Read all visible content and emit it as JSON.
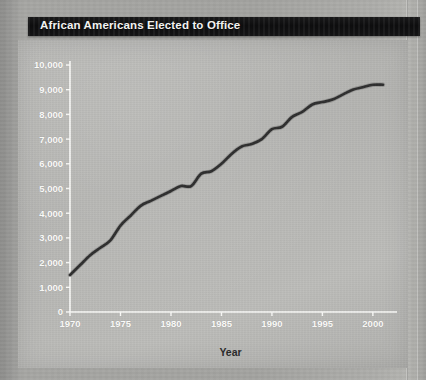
{
  "page": {
    "title": "African Americans Elected to Office"
  },
  "chart_data": {
    "type": "line",
    "title": "African Americans Elected to Office",
    "xlabel": "Year",
    "ylabel": "",
    "xlim": [
      1970,
      2001
    ],
    "ylim": [
      0,
      10000
    ],
    "grid": false,
    "legend": null,
    "line_color": "#2e2e2e",
    "x_ticks": [
      "1970",
      "1975",
      "1980",
      "1985",
      "1990",
      "1995",
      "2000"
    ],
    "x_tick_values": [
      1970,
      1975,
      1980,
      1985,
      1990,
      1995,
      2000
    ],
    "y_ticks": [
      "0",
      "1,000",
      "2,000",
      "3,000",
      "4,000",
      "5,000",
      "6,000",
      "7,000",
      "8,000",
      "9,000",
      "10,000"
    ],
    "y_tick_values": [
      0,
      1000,
      2000,
      3000,
      4000,
      5000,
      6000,
      7000,
      8000,
      9000,
      10000
    ],
    "series": [
      {
        "name": "African Americans Elected to Office",
        "x": [
          1970,
          1971,
          1972,
          1973,
          1974,
          1975,
          1976,
          1977,
          1978,
          1979,
          1980,
          1981,
          1982,
          1983,
          1984,
          1985,
          1986,
          1987,
          1988,
          1989,
          1990,
          1991,
          1992,
          1993,
          1994,
          1995,
          1996,
          1997,
          1998,
          1999,
          2000,
          2001
        ],
        "values": [
          1500,
          1900,
          2300,
          2600,
          2900,
          3500,
          3900,
          4300,
          4500,
          4700,
          4900,
          5100,
          5100,
          5600,
          5700,
          6000,
          6400,
          6700,
          6800,
          7000,
          7400,
          7500,
          7900,
          8100,
          8400,
          8500,
          8600,
          8800,
          9000,
          9100,
          9200,
          9200
        ]
      }
    ]
  },
  "axes": {
    "x_axis_label": "Year"
  }
}
